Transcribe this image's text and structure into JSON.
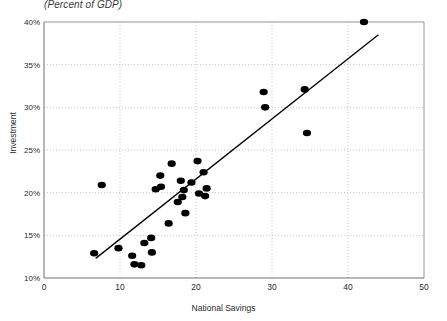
{
  "chart_data": {
    "type": "scatter",
    "title": "",
    "subtitle": "(Percent of GDP)",
    "xlabel": "National Savings",
    "ylabel": "Investment",
    "xlim": [
      0,
      50
    ],
    "ylim": [
      10,
      40
    ],
    "xticks": [
      "0",
      "10",
      "20",
      "30",
      "40",
      "50"
    ],
    "xtick_values": [
      0,
      10,
      20,
      30,
      40,
      50
    ],
    "yticks": [
      "10%",
      "15%",
      "20%",
      "25%",
      "30%",
      "35%",
      "40%"
    ],
    "ytick_values": [
      10,
      15,
      20,
      25,
      30,
      35,
      40
    ],
    "grid": true,
    "grid_style": "dotted",
    "legend": "none",
    "marker_color": "#000000",
    "marker_shape": "circle",
    "line_color": "#000000",
    "points": [
      {
        "x": 6.6,
        "y": 12.9
      },
      {
        "x": 7.6,
        "y": 20.9
      },
      {
        "x": 9.8,
        "y": 13.5
      },
      {
        "x": 11.6,
        "y": 12.6
      },
      {
        "x": 11.9,
        "y": 11.6
      },
      {
        "x": 12.8,
        "y": 11.5
      },
      {
        "x": 13.2,
        "y": 14.1
      },
      {
        "x": 14.1,
        "y": 14.7
      },
      {
        "x": 14.2,
        "y": 13.0
      },
      {
        "x": 14.7,
        "y": 20.4
      },
      {
        "x": 15.3,
        "y": 22.0
      },
      {
        "x": 15.4,
        "y": 20.7
      },
      {
        "x": 16.4,
        "y": 16.4
      },
      {
        "x": 16.8,
        "y": 23.4
      },
      {
        "x": 17.6,
        "y": 18.9
      },
      {
        "x": 18.0,
        "y": 21.4
      },
      {
        "x": 18.2,
        "y": 19.5
      },
      {
        "x": 18.4,
        "y": 20.3
      },
      {
        "x": 18.6,
        "y": 17.6
      },
      {
        "x": 19.4,
        "y": 21.2
      },
      {
        "x": 20.2,
        "y": 23.7
      },
      {
        "x": 20.4,
        "y": 19.9
      },
      {
        "x": 21.0,
        "y": 22.4
      },
      {
        "x": 21.2,
        "y": 19.6
      },
      {
        "x": 21.4,
        "y": 20.5
      },
      {
        "x": 28.9,
        "y": 31.8
      },
      {
        "x": 29.1,
        "y": 30.0
      },
      {
        "x": 34.3,
        "y": 32.1
      },
      {
        "x": 34.6,
        "y": 27.0
      },
      {
        "x": 42.1,
        "y": 40.0
      }
    ],
    "trendline": {
      "x0": 6.8,
      "y0": 12.3,
      "x1": 44.0,
      "y1": 38.5
    }
  }
}
